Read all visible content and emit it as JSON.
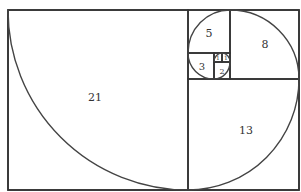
{
  "diagram": {
    "squares": [
      {
        "label": "21",
        "size": 21
      },
      {
        "label": "13",
        "size": 13
      },
      {
        "label": "8",
        "size": 8
      },
      {
        "label": "5",
        "size": 5
      },
      {
        "label": "3",
        "size": 3
      },
      {
        "label": "2",
        "size": 2
      },
      {
        "label": "1",
        "size": 1
      },
      {
        "label": "1",
        "size": 1
      }
    ],
    "colors": {
      "stroke": "#333333",
      "background": "#ffffff"
    }
  }
}
